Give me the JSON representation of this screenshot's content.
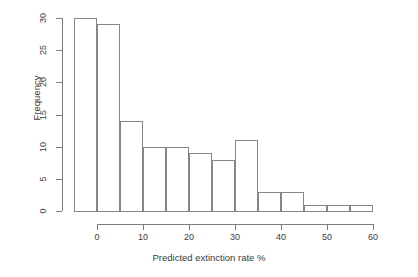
{
  "chart_data": {
    "type": "bar",
    "title": "",
    "subtitle": "",
    "xlabel": "Predicted extinction rate %",
    "ylabel": "Frequency",
    "categories": [
      "-5 to 0",
      "0 to 5",
      "5 to 10",
      "10 to 15",
      "15 to 20",
      "20 to 25",
      "25 to 30",
      "30 to 35",
      "35 to 40",
      "40 to 45",
      "45 to 50",
      "50 to 55",
      "55 to 60"
    ],
    "bin_edges": [
      -5,
      0,
      5,
      10,
      15,
      20,
      25,
      30,
      35,
      40,
      45,
      50,
      55,
      60
    ],
    "bin_width": 5,
    "values": [
      30,
      29,
      14,
      10,
      10,
      9,
      8,
      11,
      3,
      3,
      1,
      1,
      1
    ],
    "xlim": [
      -7,
      60
    ],
    "ylim": [
      0,
      30
    ],
    "xticks": [
      0,
      10,
      20,
      30,
      40,
      50,
      60
    ],
    "xtick_labels": [
      "0",
      "10",
      "20",
      "30",
      "40",
      "50",
      "60"
    ],
    "yticks": [
      0,
      5,
      10,
      15,
      20,
      25,
      30
    ],
    "ytick_labels": [
      "0",
      "5",
      "10",
      "15",
      "20",
      "25",
      "30"
    ],
    "grid": false,
    "legend": null,
    "bar_fill": "#ffffff",
    "bar_stroke": "#878787",
    "axis_color": "#7d7d7d",
    "text_color": "#3c3c3c",
    "background": "#ffffff"
  }
}
